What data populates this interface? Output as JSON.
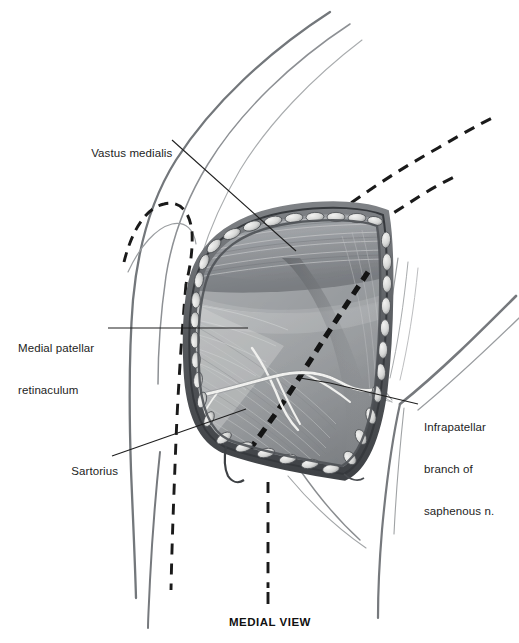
{
  "figure": {
    "kind": "anatomical-illustration",
    "caption": "MEDIAL VIEW",
    "palette": {
      "background": "#ffffff",
      "outline": "#6f7377",
      "dashed_incision": "#1a1a1a",
      "skin_edge": "#55595e",
      "muscle_light": "#c9cacb",
      "muscle_mid": "#9a9c9f",
      "muscle_dark": "#6d7074",
      "nerve": "#e8e8e6",
      "leader_line": "#222222",
      "text": "#1d1d1d"
    }
  },
  "labels": [
    {
      "id": "vastus-medialis",
      "text": "Vastus medialis",
      "lines": [
        "Vastus medialis"
      ],
      "x": 78,
      "y": 132,
      "align": "left",
      "leader": {
        "from_x": 172,
        "from_y": 141,
        "to_x": 296,
        "to_y": 251
      }
    },
    {
      "id": "medial-patellar-retinaculum",
      "text": "Medial patellar retinaculum",
      "lines": [
        "Medial patellar",
        "retinaculum"
      ],
      "x": 18,
      "y": 313,
      "align": "left",
      "leader": {
        "from_x": 108,
        "from_y": 328,
        "to_x": 248,
        "to_y": 328
      }
    },
    {
      "id": "sartorius",
      "text": "Sartorius",
      "lines": [
        "Sartorius"
      ],
      "x": 58,
      "y": 450,
      "align": "left",
      "leader": {
        "from_x": 112,
        "from_y": 456,
        "to_x": 246,
        "to_y": 409
      }
    },
    {
      "id": "infrapatellar-branch-of-saphenous-nerve",
      "text": "Infrapatellar branch of saphenous n.",
      "lines": [
        "Infrapatellar",
        "branch of",
        "saphenous n."
      ],
      "x": 424,
      "y": 392,
      "align": "left",
      "leader": {
        "from_x": 418,
        "from_y": 404,
        "to_x": 330,
        "to_y": 383
      }
    }
  ],
  "annotations": {
    "dashed_incision_label": "planned / marked incision line",
    "wound_label": "open surgical wound with retracted skin edges",
    "nerve_label": "infrapatellar branch crossing the field"
  }
}
